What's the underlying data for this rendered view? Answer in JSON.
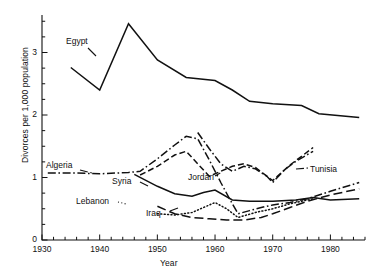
{
  "chart_data": {
    "type": "line",
    "title": "",
    "xlabel": "Year",
    "ylabel": "Divorces per 1,000 population",
    "xlim": [
      1930,
      1986
    ],
    "ylim": [
      0,
      3.6
    ],
    "xticks": [
      1930,
      1940,
      1950,
      1960,
      1970,
      1980
    ],
    "xtick_labels": [
      "1930",
      "1940",
      "1950",
      "1960",
      "1970",
      "1980"
    ],
    "minor_xtick_step": 2,
    "yticks": [
      0,
      1,
      2,
      3
    ],
    "ytick_labels": [
      "0",
      "1",
      "2",
      "3"
    ],
    "minor_ytick_step": 0.25,
    "grid": false,
    "legend": "inline-labels",
    "series": [
      {
        "name": "Egypt",
        "style": "solid",
        "label_x": 66,
        "label_y": 36,
        "leader": [
          [
            88,
            48
          ],
          [
            96,
            56
          ]
        ],
        "points": [
          [
            1935,
            2.76
          ],
          [
            1940,
            2.4
          ],
          [
            1945,
            3.46
          ],
          [
            1950,
            2.88
          ],
          [
            1955,
            2.6
          ],
          [
            1960,
            2.55
          ],
          [
            1963,
            2.4
          ],
          [
            1966,
            2.22
          ],
          [
            1970,
            2.18
          ],
          [
            1975,
            2.15
          ],
          [
            1978,
            2.02
          ],
          [
            1985,
            1.96
          ]
        ]
      },
      {
        "name": "Algeria",
        "style": "dashdot",
        "label_x": 46,
        "label_y": 160,
        "leader": [
          [
            80,
            170
          ],
          [
            92,
            173
          ]
        ],
        "points": [
          [
            1931,
            1.07
          ],
          [
            1936,
            1.07
          ],
          [
            1940,
            1.06
          ],
          [
            1945,
            1.08
          ],
          [
            1947,
            1.1
          ],
          [
            1950,
            1.3
          ],
          [
            1953,
            1.52
          ],
          [
            1955,
            1.66
          ],
          [
            1957,
            1.62
          ],
          [
            1959,
            1.28
          ],
          [
            1961,
            0.92
          ],
          [
            1963,
            0.58
          ],
          [
            1964,
            0.42
          ],
          [
            1966,
            0.47
          ],
          [
            1968,
            0.52
          ],
          [
            1970,
            0.56
          ],
          [
            1973,
            0.6
          ],
          [
            1976,
            0.66
          ],
          [
            1980,
            0.78
          ],
          [
            1985,
            0.92
          ]
        ]
      },
      {
        "name": "Jordan",
        "style": "dashed",
        "label_x": 188,
        "label_y": 172,
        "leader": [
          [
            215,
            176
          ],
          [
            222,
            172
          ]
        ],
        "points": [
          [
            1947,
            1.04
          ],
          [
            1950,
            1.18
          ],
          [
            1953,
            1.36
          ],
          [
            1955,
            1.42
          ],
          [
            1957,
            1.22
          ],
          [
            1959,
            1.02
          ],
          [
            1961,
            1.1
          ],
          [
            1963,
            1.18
          ],
          [
            1965,
            1.22
          ],
          [
            1967,
            1.16
          ],
          [
            1970,
            0.95
          ],
          [
            1973,
            1.2
          ],
          [
            1975,
            1.34
          ],
          [
            1977,
            1.48
          ]
        ]
      },
      {
        "name": "Syria",
        "style": "solid",
        "label_x": 112,
        "label_y": 176,
        "leader": [
          [
            140,
            182
          ],
          [
            148,
            186
          ]
        ],
        "points": [
          [
            1946,
            1.05
          ],
          [
            1950,
            0.86
          ],
          [
            1953,
            0.74
          ],
          [
            1956,
            0.7
          ],
          [
            1958,
            0.76
          ],
          [
            1960,
            0.8
          ],
          [
            1963,
            0.64
          ],
          [
            1966,
            0.62
          ],
          [
            1970,
            0.62
          ],
          [
            1974,
            0.64
          ],
          [
            1977,
            0.68
          ],
          [
            1980,
            0.64
          ],
          [
            1985,
            0.66
          ]
        ]
      },
      {
        "name": "Lebanon",
        "style": "dotted",
        "label_x": 76,
        "label_y": 196,
        "leader": [
          [
            118,
            202
          ],
          [
            126,
            204
          ]
        ],
        "points": [
          [
            1950,
            0.42
          ],
          [
            1953,
            0.4
          ],
          [
            1956,
            0.44
          ],
          [
            1959,
            0.56
          ],
          [
            1960,
            0.6
          ],
          [
            1962,
            0.5
          ],
          [
            1964,
            0.36
          ],
          [
            1967,
            0.44
          ],
          [
            1970,
            0.5
          ],
          [
            1973,
            0.58
          ],
          [
            1975,
            0.62
          ],
          [
            1977,
            0.66
          ]
        ]
      },
      {
        "name": "Iraq",
        "style": "longdash",
        "label_x": 146,
        "label_y": 208,
        "leader": [
          [
            170,
            211
          ],
          [
            178,
            208
          ]
        ],
        "points": [
          [
            1950,
            0.54
          ],
          [
            1953,
            0.42
          ],
          [
            1956,
            0.36
          ],
          [
            1959,
            0.34
          ],
          [
            1962,
            0.32
          ],
          [
            1965,
            0.32
          ],
          [
            1968,
            0.36
          ],
          [
            1970,
            0.42
          ],
          [
            1973,
            0.52
          ],
          [
            1976,
            0.62
          ],
          [
            1980,
            0.72
          ],
          [
            1985,
            0.82
          ]
        ]
      },
      {
        "name": "Tunisia",
        "style": "dashdot",
        "label_x": 310,
        "label_y": 164,
        "leader": [
          [
            296,
            169
          ],
          [
            308,
            168
          ]
        ],
        "points": [
          [
            1957,
            1.72
          ],
          [
            1959,
            1.46
          ],
          [
            1961,
            1.22
          ],
          [
            1963,
            1.1
          ],
          [
            1965,
            1.18
          ],
          [
            1967,
            1.14
          ],
          [
            1969,
            1.02
          ],
          [
            1970,
            0.92
          ],
          [
            1972,
            1.12
          ],
          [
            1974,
            1.26
          ],
          [
            1977,
            1.42
          ]
        ]
      }
    ]
  },
  "labels": {
    "egypt": "Egypt",
    "algeria": "Algeria",
    "jordan": "Jordan",
    "syria": "Syria",
    "lebanon": "Lebanon",
    "iraq": "Iraq",
    "tunisia": "Tunisia"
  }
}
